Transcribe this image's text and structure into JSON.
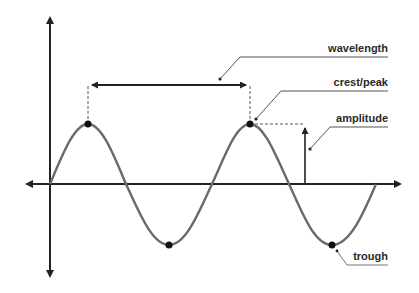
{
  "diagram": {
    "type": "wave-anatomy",
    "labels": {
      "wavelength": "wavelength",
      "crest": "crest/peak",
      "amplitude": "amplitude",
      "trough": "trough"
    },
    "colors": {
      "axis": "#222222",
      "wave": "#6a6a6a",
      "dashed": "#555555",
      "leader": "#555555",
      "text": "#2a2a2a",
      "point": "#111111"
    },
    "geometry": {
      "origin": [
        50,
        184
      ],
      "amplitude_px": 60,
      "wavelength_px": 162,
      "peaks": [
        [
          88,
          124
        ],
        [
          250,
          124
        ]
      ],
      "troughs": [
        [
          169,
          245
        ],
        [
          332,
          245
        ]
      ]
    }
  }
}
